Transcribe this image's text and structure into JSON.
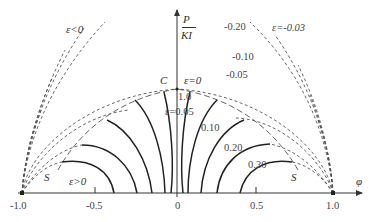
{
  "diagram": {
    "type": "contour-plot",
    "axes": {
      "x_label": "φ",
      "y_label_numerator": "P",
      "y_label_denominator": "KI",
      "x_ticks": [
        "-1.0",
        "-0.5",
        "0",
        "0.5",
        "1.0"
      ]
    },
    "regions": {
      "negative": "ε<0",
      "positive": "ε>0",
      "zero": "ε=0"
    },
    "points": {
      "C": "C",
      "S_left": "S",
      "S_right": "S"
    },
    "value_labels": {
      "c_value": "1.0",
      "eps_005": "ε=0.05",
      "v010": "0.10",
      "v020": "0.20",
      "v030": "0.30",
      "n020": "-0.20",
      "n010": "-0.10",
      "n005": "-0.05",
      "n003": "ε=-0.03"
    },
    "line_styles": {
      "solid": "ε>0 contours",
      "dashed": "ε<0 contours"
    },
    "colors": {
      "line": "#222222",
      "dashed": "#555555",
      "background": "#ffffff"
    }
  }
}
